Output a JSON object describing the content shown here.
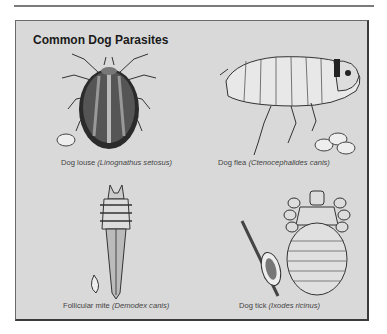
{
  "title": "Common Dog Parasites",
  "figures": [
    {
      "common": "Dog louse",
      "scientific": "(Linognathus setosus)",
      "icon": "tick-body-illustration"
    },
    {
      "common": "Dog flea",
      "scientific": "(Ctenocephalides canis)",
      "icon": "flea-illustration"
    },
    {
      "common": "Follicular mite",
      "scientific": "(Demodex canis)",
      "icon": "mite-illustration"
    },
    {
      "common": "Dog tick",
      "scientific": "(Ixodes ricinus)",
      "icon": "louse-illustration"
    }
  ],
  "colors": {
    "panel": "#d9d9d9",
    "border": "#3a3a3a",
    "title": "#1a1a1a",
    "caption": "#444444"
  }
}
